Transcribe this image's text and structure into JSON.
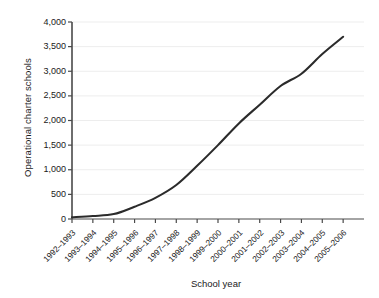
{
  "chart_data": {
    "type": "line",
    "title": "",
    "xlabel": "School year",
    "ylabel": "Operational charter schools",
    "categories": [
      "1992–1993",
      "1993–1994",
      "1994–1995",
      "1995–1996",
      "1996–1997",
      "1997–1998",
      "1998–1999",
      "1999–2000",
      "2000–2001",
      "2001–2002",
      "2002–2003",
      "2003–2004",
      "2004–2005",
      "2005–2006"
    ],
    "values": [
      35,
      60,
      100,
      250,
      430,
      690,
      1080,
      1500,
      1940,
      2320,
      2700,
      2950,
      3350,
      3700
    ],
    "series": [
      {
        "name": "Operational charter schools",
        "values": [
          35,
          60,
          100,
          250,
          430,
          690,
          1080,
          1500,
          1940,
          2320,
          2700,
          2950,
          3350,
          3700
        ]
      }
    ],
    "ylim": [
      0,
      4000
    ],
    "ytick_labels": [
      "0",
      "500",
      "1,000",
      "1,500",
      "2,000",
      "2,500",
      "3,000",
      "3,500",
      "4,000"
    ],
    "ytick_values": [
      0,
      500,
      1000,
      1500,
      2000,
      2500,
      3000,
      3500,
      4000
    ],
    "grid": true,
    "grid_axis": "y",
    "legend": false,
    "legend_position": "none",
    "line_color": "#2b2b2b",
    "grid_color": "#ededed",
    "axis_color": "#4a4a4a",
    "background": "#ffffff"
  },
  "layout": {
    "plot_left": 72,
    "plot_right": 364,
    "plot_top": 22,
    "plot_bottom": 219
  }
}
